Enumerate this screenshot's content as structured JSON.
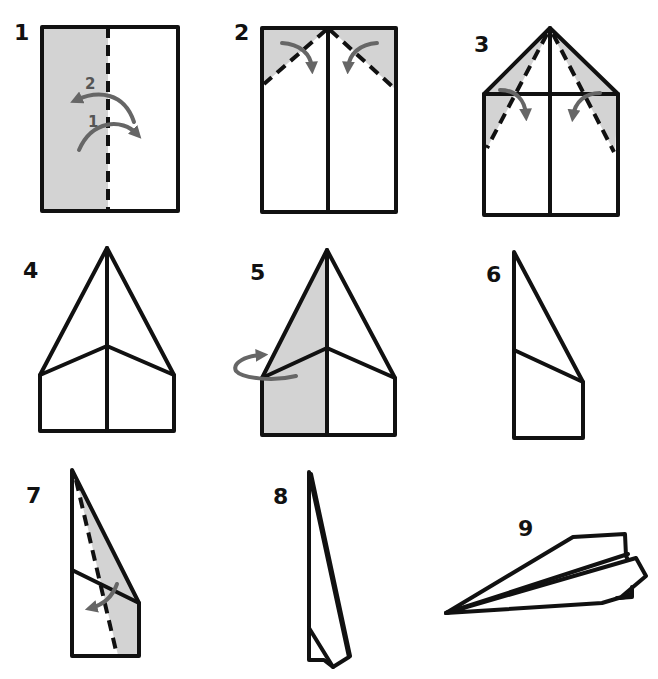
{
  "colors": {
    "line": "#111111",
    "shade": "#d3d3d3",
    "arrow": "#666666",
    "background": "#ffffff"
  },
  "steps": [
    {
      "number": "1",
      "description": "Fold sheet in half lengthwise, then unfold",
      "arrow_labels": [
        "2",
        "1"
      ]
    },
    {
      "number": "2",
      "description": "Fold top corners to the center crease"
    },
    {
      "number": "3",
      "description": "Fold the new angled edges to the center again"
    },
    {
      "number": "4",
      "description": "Result: pointed nose"
    },
    {
      "number": "5",
      "description": "Fold the model in half along the center crease"
    },
    {
      "number": "6",
      "description": "Folded half, side view"
    },
    {
      "number": "7",
      "description": "Fold the wing down along the dashed line"
    },
    {
      "number": "8",
      "description": "Wing folded down"
    },
    {
      "number": "9",
      "description": "Finished paper airplane"
    }
  ]
}
